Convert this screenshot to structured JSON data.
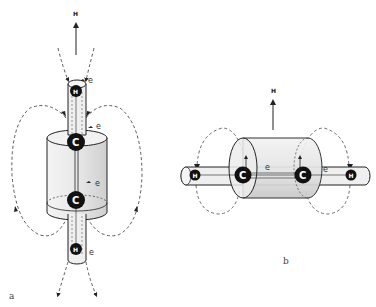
{
  "diagram": {
    "panels": [
      {
        "id": "a",
        "label": "a",
        "field_label": "H",
        "orientation": "vertical",
        "atoms": [
          "H",
          "C",
          "C",
          "H"
        ],
        "electron_labels": [
          "e",
          "e",
          "e",
          "e"
        ]
      },
      {
        "id": "b",
        "label": "b",
        "field_label": "H",
        "orientation": "horizontal",
        "atoms": [
          "H",
          "C",
          "C",
          "H"
        ],
        "electron_labels": [
          "e",
          "e"
        ]
      }
    ],
    "colors": {
      "line": "#222222",
      "dashed": "#444444",
      "cylinder_fill": "#e6e6e6",
      "atom_fill": "#111111",
      "background": "#ffffff"
    }
  }
}
